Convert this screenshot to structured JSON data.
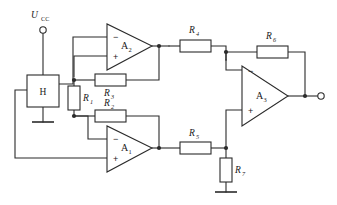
{
  "diagram": {
    "background_color": "#ffffff",
    "line_color": "#2b2b2b",
    "text_color": "#1a1a1a"
  },
  "supply": {
    "label": "U",
    "label_subscript": "CC",
    "terminal_name": "supply-terminal"
  },
  "hall_element": {
    "label": "H",
    "name": "hall-element"
  },
  "opamps": [
    {
      "id": "a2",
      "label": "A",
      "subscript": "2",
      "minus": "−",
      "plus": "+"
    },
    {
      "id": "a1",
      "label": "A",
      "subscript": "1",
      "minus": "−",
      "plus": "+"
    },
    {
      "id": "a3",
      "label": "A",
      "subscript": "3",
      "minus": "−",
      "plus": "+"
    }
  ],
  "resistors": [
    {
      "id": "r1",
      "label": "R",
      "subscript": "1",
      "orientation": "vertical"
    },
    {
      "id": "r2",
      "label": "R",
      "subscript": "2",
      "orientation": "horizontal"
    },
    {
      "id": "r3",
      "label": "R",
      "subscript": "3",
      "orientation": "horizontal"
    },
    {
      "id": "r4",
      "label": "R",
      "subscript": "4",
      "orientation": "horizontal"
    },
    {
      "id": "r5",
      "label": "R",
      "subscript": "5",
      "orientation": "horizontal"
    },
    {
      "id": "r6",
      "label": "R",
      "subscript": "6",
      "orientation": "horizontal"
    },
    {
      "id": "r7",
      "label": "R",
      "subscript": "7",
      "orientation": "vertical"
    }
  ],
  "output": {
    "terminal_name": "output-terminal"
  },
  "grounds": [
    {
      "id": "gnd-hall",
      "name": "ground-hall-element"
    },
    {
      "id": "gnd-r7",
      "name": "ground-r7"
    }
  ]
}
